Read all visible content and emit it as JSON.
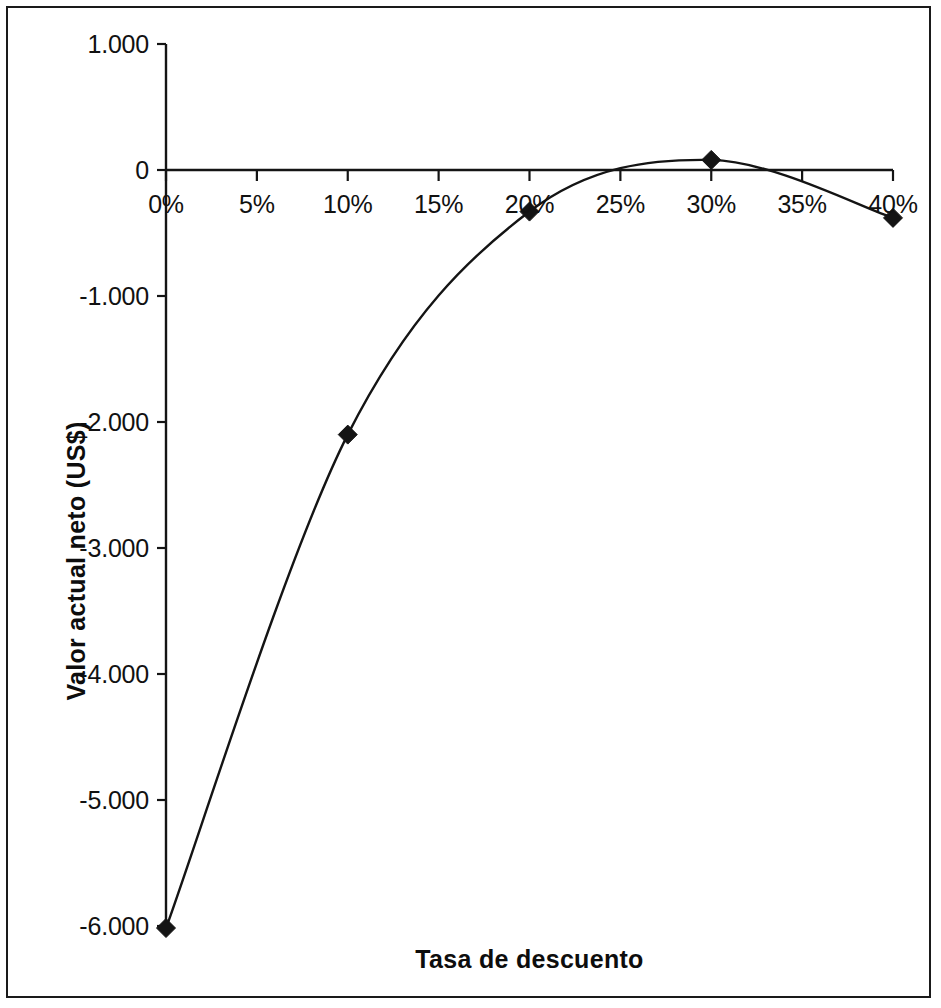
{
  "chart_data": {
    "type": "line",
    "title": "",
    "subtitle": "",
    "xlabel": "Tasa de descuento",
    "ylabel": "Valor actual neto (US$)",
    "x": [
      0,
      10,
      20,
      30,
      40
    ],
    "categories": [
      "0%",
      "10%",
      "20%",
      "30%",
      "40%"
    ],
    "values": [
      -6.016,
      -2.1,
      -0.33,
      0.08,
      -0.38
    ],
    "series": [
      {
        "name": "Valor actual neto",
        "values": [
          -6.016,
          -2.1,
          -0.33,
          0.08,
          -0.38
        ]
      }
    ],
    "xlim": [
      0,
      40
    ],
    "ylim": [
      -6.016,
      1.0
    ],
    "x_tick_values": [
      0,
      5,
      10,
      15,
      20,
      25,
      30,
      35,
      40
    ],
    "x_tick_labels": [
      "0%",
      "5%",
      "10%",
      "15%",
      "20%",
      "25%",
      "30%",
      "35%",
      "40%"
    ],
    "y_tick_values": [
      1.0,
      0,
      -1.0,
      -2.0,
      -3.0,
      -4.0,
      -5.0,
      -6.0
    ],
    "y_tick_labels": [
      "1.000",
      "0",
      "-1.000",
      "-2.000",
      "-3.000",
      "-4.000",
      "-5.000",
      "-6.000"
    ],
    "grid": false,
    "legend": false,
    "legend_position": "none",
    "marker": "diamond",
    "line_color": "#141414",
    "marker_color": "#141414",
    "axis_color": "#141414",
    "background_color": "#ffffff",
    "smooth": true,
    "annotations": []
  },
  "axis_titles": {
    "y": "Valor actual neto (US$)",
    "x": "Tasa de descuento"
  }
}
